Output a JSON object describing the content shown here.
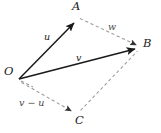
{
  "figure": {
    "width": 161,
    "height": 133,
    "background_color": "#ffffff",
    "solid_stroke_color": "#1a1a1a",
    "dashed_stroke_color": "#9a9a9a",
    "label_color": "#1a1a1a"
  },
  "points": [
    {
      "id": "O",
      "label": "O",
      "x": 19,
      "y": 79
    },
    {
      "id": "A",
      "label": "A",
      "x": 77,
      "y": 20
    },
    {
      "id": "B",
      "label": "B",
      "x": 139,
      "y": 48
    },
    {
      "id": "C",
      "label": "C",
      "x": 75,
      "y": 113
    }
  ],
  "vectors": [
    {
      "id": "u",
      "label": "u",
      "from": "O",
      "to": "A",
      "style": "solid",
      "arrow": "end",
      "x1": 19,
      "y1": 79,
      "x2": 77,
      "y2": 20
    },
    {
      "id": "v",
      "label": "v",
      "from": "O",
      "to": "B",
      "style": "solid",
      "arrow": "end",
      "x1": 19,
      "y1": 79,
      "x2": 139,
      "y2": 48
    },
    {
      "id": "w",
      "label": "w",
      "from": "A",
      "to": "B",
      "style": "dashed",
      "arrow": "end",
      "x1": 79,
      "y1": 19,
      "x2": 139,
      "y2": 47
    },
    {
      "id": "v-minus-u",
      "label": "v − u",
      "from": "O",
      "to": "C",
      "style": "dashed",
      "arrow": "end",
      "x1": 21,
      "y1": 82,
      "x2": 75,
      "y2": 113
    },
    {
      "id": "cb",
      "label": "",
      "from": "C",
      "to": "B",
      "style": "dashed",
      "arrow": "end",
      "x1": 80,
      "y1": 112,
      "x2": 139,
      "y2": 50
    }
  ]
}
